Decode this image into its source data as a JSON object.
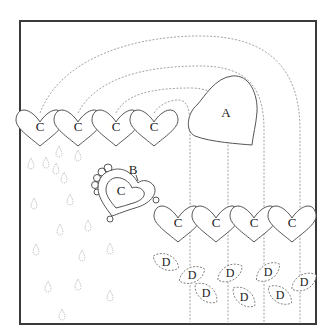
{
  "diagram": {
    "type": "applique-pattern",
    "labels": {
      "large_heart": "A",
      "scalloped_heart_border": "B",
      "heart": "C",
      "leaf": "D"
    },
    "top_row_hearts": [
      "C",
      "C",
      "C",
      "C"
    ],
    "bottom_row_hearts": [
      "C",
      "C",
      "C",
      "C"
    ],
    "center_heart": "C",
    "leaves": [
      "D",
      "D",
      "D",
      "D",
      "D",
      "D",
      "D",
      "D"
    ],
    "colors": {
      "frame": "#3a3a3a",
      "outline": "#555555",
      "dashed": "#8a8a8a",
      "background": "#ffffff"
    }
  }
}
